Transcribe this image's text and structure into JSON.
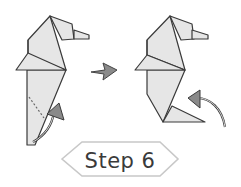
{
  "diagram": {
    "step_label": "Step 6",
    "figures": [
      {
        "name": "before-fold",
        "description": "Seahorse with dotted fold line and curved arrow indicating tail fold upward"
      },
      {
        "name": "after-fold",
        "description": "Seahorse with folded tail and curved arrow indicating next fold"
      }
    ],
    "transition_arrow": "right-arrow",
    "colors": {
      "paper_fill": "#e6e6e6",
      "outline": "#3a3a3a",
      "arrow_fill": "#8a8a8a",
      "badge_border": "#c8c8c8"
    }
  }
}
